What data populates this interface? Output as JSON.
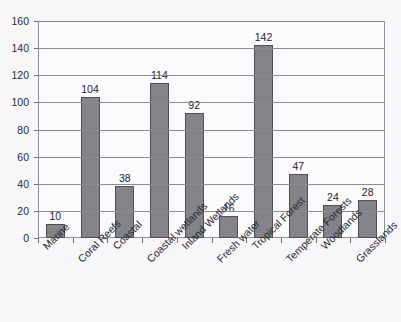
{
  "chart_data": {
    "type": "bar",
    "title": "",
    "xlabel": "",
    "ylabel": "",
    "ylim": [
      0,
      160
    ],
    "ytick_step": 20,
    "yticks": [
      0,
      20,
      40,
      60,
      80,
      100,
      120,
      140,
      160
    ],
    "grid": true,
    "legend": "none",
    "bar_color": "#838389",
    "bar_edge_color": "#4f4f55",
    "plot_background": "#fbfbfd",
    "figure_background": "#f7f7f9",
    "axis_color": "#8e8e94",
    "gridline_color": "#8b8b90",
    "tick_label_rotation": -45,
    "show_value_labels": true,
    "categories": [
      "Marine",
      "Coral Reefs",
      "Coastal",
      "Coastal wetlands",
      "Inland Wetlands",
      "Fresh water",
      "Tropical Forest",
      "Temperate Forests",
      "Woodlands",
      "Grasslands"
    ],
    "values": [
      10,
      104,
      38,
      114,
      92,
      16,
      142,
      47,
      24,
      28
    ]
  }
}
